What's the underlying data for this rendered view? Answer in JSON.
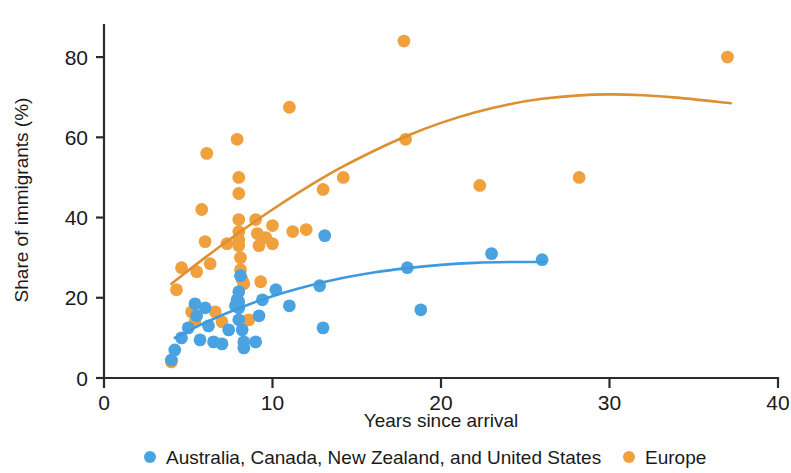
{
  "chart_data": {
    "type": "scatter",
    "title": "",
    "xlabel": "Years since arrival",
    "ylabel": "Share of immigrants (%)",
    "xlim": [
      0,
      40
    ],
    "ylim": [
      0,
      88
    ],
    "xticks": [
      0,
      10,
      20,
      30,
      40
    ],
    "yticks": [
      0,
      20,
      40,
      60,
      80
    ],
    "xtick_labels": [
      "0",
      "10",
      "20",
      "30",
      "40"
    ],
    "ytick_labels": [
      "0",
      "20",
      "40",
      "60",
      "80"
    ],
    "grid": false,
    "legend_position": "bottom",
    "series": [
      {
        "name": "Australia, Canada, New Zealand, and United States",
        "key": "anglosphere",
        "color": "#4aa3e0",
        "marker": "circle",
        "points": [
          [
            4.0,
            4.5
          ],
          [
            4.2,
            7.0
          ],
          [
            4.6,
            10.0
          ],
          [
            5.0,
            12.5
          ],
          [
            5.4,
            18.5
          ],
          [
            5.5,
            15.5
          ],
          [
            5.7,
            9.5
          ],
          [
            6.0,
            17.5
          ],
          [
            6.2,
            13.0
          ],
          [
            6.5,
            9.0
          ],
          [
            7.0,
            8.5
          ],
          [
            7.4,
            12.0
          ],
          [
            7.8,
            18.0
          ],
          [
            7.9,
            19.5
          ],
          [
            8.0,
            14.5
          ],
          [
            8.0,
            17.5
          ],
          [
            8.0,
            19.0
          ],
          [
            8.0,
            21.5
          ],
          [
            8.1,
            25.5
          ],
          [
            8.2,
            12.0
          ],
          [
            8.3,
            9.0
          ],
          [
            8.3,
            7.5
          ],
          [
            9.0,
            9.0
          ],
          [
            9.2,
            15.5
          ],
          [
            9.4,
            19.5
          ],
          [
            10.2,
            22.0
          ],
          [
            11.0,
            18.0
          ],
          [
            12.8,
            23.0
          ],
          [
            13.0,
            12.5
          ],
          [
            13.1,
            35.5
          ],
          [
            18.0,
            27.5
          ],
          [
            18.8,
            17.0
          ],
          [
            23.0,
            31.0
          ],
          [
            26.0,
            29.5
          ]
        ]
      },
      {
        "name": "Europe",
        "key": "europe",
        "color": "#f0a03c",
        "marker": "circle",
        "points": [
          [
            4.0,
            4.0
          ],
          [
            4.3,
            22.0
          ],
          [
            4.6,
            27.5
          ],
          [
            5.2,
            16.5
          ],
          [
            5.4,
            14.0
          ],
          [
            5.5,
            26.5
          ],
          [
            5.8,
            42.0
          ],
          [
            6.0,
            34.0
          ],
          [
            6.1,
            56.0
          ],
          [
            6.3,
            28.5
          ],
          [
            6.6,
            16.5
          ],
          [
            7.0,
            14.0
          ],
          [
            7.3,
            33.5
          ],
          [
            7.9,
            59.5
          ],
          [
            8.0,
            50.0
          ],
          [
            8.0,
            46.0
          ],
          [
            8.0,
            39.5
          ],
          [
            8.0,
            36.5
          ],
          [
            8.0,
            34.5
          ],
          [
            8.0,
            33.0
          ],
          [
            8.1,
            30.0
          ],
          [
            8.1,
            27.0
          ],
          [
            8.2,
            24.5
          ],
          [
            8.3,
            23.5
          ],
          [
            8.6,
            14.5
          ],
          [
            9.0,
            39.5
          ],
          [
            9.1,
            36.0
          ],
          [
            9.2,
            33.0
          ],
          [
            9.3,
            24.0
          ],
          [
            9.6,
            35.0
          ],
          [
            10.0,
            38.0
          ],
          [
            10.0,
            33.5
          ],
          [
            11.0,
            67.5
          ],
          [
            11.2,
            36.5
          ],
          [
            12.0,
            37.0
          ],
          [
            13.0,
            47.0
          ],
          [
            14.2,
            50.0
          ],
          [
            17.8,
            84.0
          ],
          [
            17.9,
            59.5
          ],
          [
            22.3,
            48.0
          ],
          [
            28.2,
            50.0
          ],
          [
            37.0,
            80.0
          ]
        ]
      }
    ],
    "trendlines": [
      {
        "series": "anglosphere",
        "color": "#3d9ade",
        "path": [
          [
            4.2,
            10.0
          ],
          [
            6.0,
            13.8
          ],
          [
            8.0,
            17.4
          ],
          [
            10.0,
            20.4
          ],
          [
            12.0,
            22.8
          ],
          [
            14.0,
            24.8
          ],
          [
            16.0,
            26.3
          ],
          [
            18.0,
            27.4
          ],
          [
            20.0,
            28.2
          ],
          [
            22.0,
            28.7
          ],
          [
            24.0,
            28.9
          ],
          [
            26.2,
            28.9
          ]
        ]
      },
      {
        "series": "europe",
        "color": "#dd8f33",
        "path": [
          [
            4.0,
            23.5
          ],
          [
            6.0,
            30.0
          ],
          [
            8.0,
            36.2
          ],
          [
            10.0,
            42.0
          ],
          [
            12.0,
            47.4
          ],
          [
            14.0,
            52.3
          ],
          [
            16.0,
            56.6
          ],
          [
            18.0,
            60.4
          ],
          [
            20.0,
            63.6
          ],
          [
            22.0,
            66.2
          ],
          [
            24.0,
            68.2
          ],
          [
            26.0,
            69.6
          ],
          [
            28.0,
            70.4
          ],
          [
            30.0,
            70.7
          ],
          [
            32.0,
            70.5
          ],
          [
            34.0,
            69.9
          ],
          [
            37.2,
            68.5
          ]
        ]
      }
    ],
    "legend": [
      {
        "label": "Australia, Canada, New Zealand, and United States",
        "color": "#4aa3e0"
      },
      {
        "label": "Europe",
        "color": "#f0a03c"
      }
    ]
  }
}
